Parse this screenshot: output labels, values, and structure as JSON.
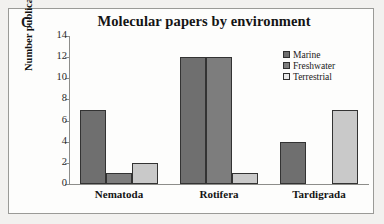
{
  "panel_label": "C",
  "chart_data": {
    "type": "bar",
    "title": "Molecular papers by environment",
    "xlabel": "",
    "ylabel": "Number publications",
    "categories": [
      "Nematoda",
      "Rotifera",
      "Tardigrada"
    ],
    "series": [
      {
        "name": "Marine",
        "values": [
          7,
          12,
          4
        ],
        "color": "#6f6f6f"
      },
      {
        "name": "Freshwater",
        "values": [
          1,
          12,
          0
        ],
        "color": "#7d7d7d"
      },
      {
        "name": "Terrestrial",
        "values": [
          2,
          1,
          7
        ],
        "color": "#c9c9c9"
      }
    ],
    "ylim": [
      0,
      14
    ],
    "yticks": [
      0,
      2,
      4,
      6,
      8,
      10,
      12,
      14
    ],
    "ytick_labels": [
      "0",
      "2",
      "4",
      "6",
      "8",
      "10",
      "12",
      "14"
    ],
    "grid": false,
    "legend_position": "top-right"
  }
}
